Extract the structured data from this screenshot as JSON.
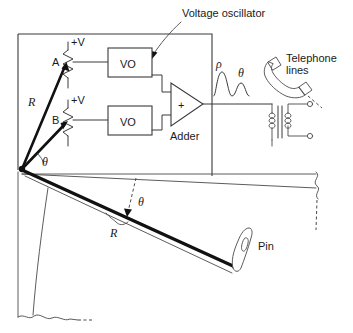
{
  "figure": {
    "colors": {
      "ink": "#1a1a1a",
      "line": "#3a3a3a",
      "thick_line": "#111111",
      "background": "#ffffff"
    }
  },
  "labels": {
    "voltage_oscillator": "Voltage oscillator",
    "pot_a": "A",
    "pot_b": "B",
    "supply_a": "+V",
    "supply_b": "+V",
    "vo_box_top": "VO",
    "vo_box_bottom": "VO",
    "adder_symbol": "+",
    "adder": "Adder",
    "vector_r_upper": "R",
    "angle_theta_upper": "θ",
    "pulse_rho": "ρ",
    "pulse_theta": "θ",
    "telephone_lines_line1": "Telephone",
    "telephone_lines_line2": "lines",
    "arm_theta": "θ",
    "arm_r": "R",
    "pin": "Pin"
  }
}
